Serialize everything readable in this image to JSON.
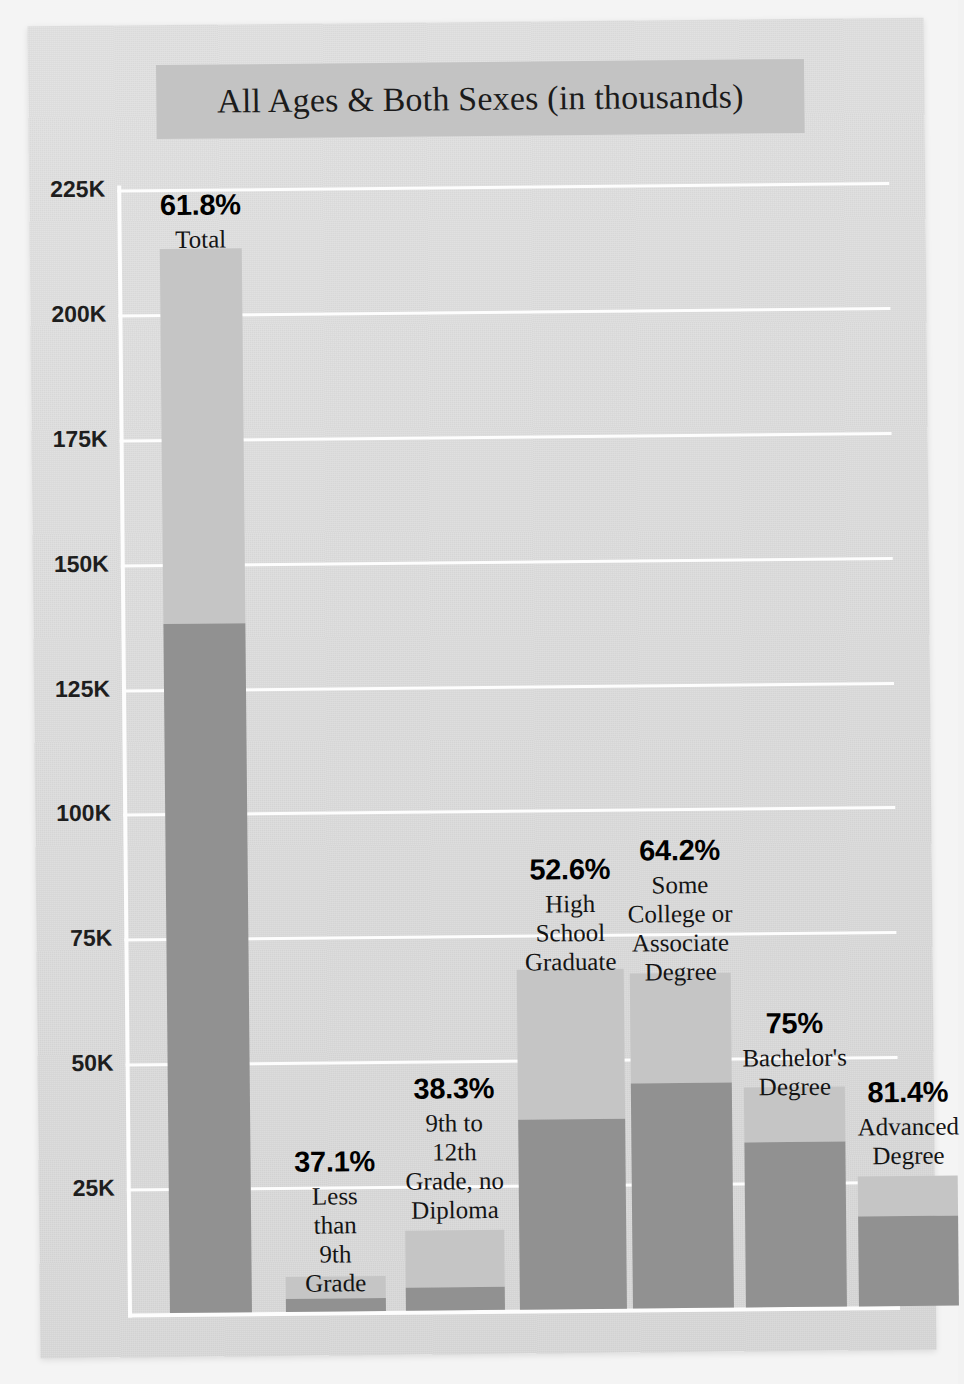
{
  "title": "All Ages & Both Sexes (in thousands)",
  "chart_data": {
    "type": "bar",
    "title": "All Ages & Both Sexes (in thousands)",
    "xlabel": "",
    "ylabel": "",
    "ylim": [
      0,
      225000
    ],
    "y_unit": "thousands",
    "grid": true,
    "legend": "none",
    "stacked": true,
    "axis": {
      "ticks": [
        "25K",
        "50K",
        "75K",
        "100K",
        "125K",
        "150K",
        "175K",
        "200K",
        "225K"
      ],
      "tick_values": [
        25000,
        50000,
        75000,
        100000,
        125000,
        150000,
        175000,
        200000,
        225000
      ]
    },
    "colors": {
      "lower_segment": "#919191",
      "upper_segment": "#c5c5c5",
      "gridline": "#fdfdfd",
      "title_banner": "#c3c3c3",
      "card_background": "#dcdcdc"
    },
    "categories": [
      "Total",
      "Less than 9th Grade",
      "9th to 12th Grade, no Diploma",
      "High School Graduate",
      "Some College or Associate Degree",
      "Bachelor's Degree",
      "Advanced Degree"
    ],
    "annotations": [
      "61.8%",
      "37.1%",
      "38.3%",
      "52.6%",
      "64.2%",
      "75%",
      "81.4%"
    ],
    "series": [
      {
        "name": "lower segment",
        "values": [
          138000,
          2600,
          4600,
          38000,
          45000,
          33000,
          18000
        ]
      },
      {
        "name": "upper segment",
        "values": [
          75000,
          4400,
          11400,
          30000,
          22000,
          11000,
          8000
        ]
      }
    ],
    "totals": [
      213000,
      7000,
      16000,
      68000,
      67000,
      44000,
      26000
    ]
  },
  "bars": [
    {
      "pct": "61.8%",
      "label_lines": [
        "Total"
      ]
    },
    {
      "pct": "37.1%",
      "label_lines": [
        "Less",
        "than",
        "9th",
        "Grade"
      ]
    },
    {
      "pct": "38.3%",
      "label_lines": [
        "9th to",
        "12th",
        "Grade, no",
        "Diploma"
      ]
    },
    {
      "pct": "52.6%",
      "label_lines": [
        "High",
        "School",
        "Graduate"
      ]
    },
    {
      "pct": "64.2%",
      "label_lines": [
        "Some",
        "College or",
        "Associate",
        "Degree"
      ]
    },
    {
      "pct": "75%",
      "label_lines": [
        "Bachelor's",
        "Degree"
      ]
    },
    {
      "pct": "81.4%",
      "label_lines": [
        "Advanced",
        "Degree"
      ]
    }
  ]
}
